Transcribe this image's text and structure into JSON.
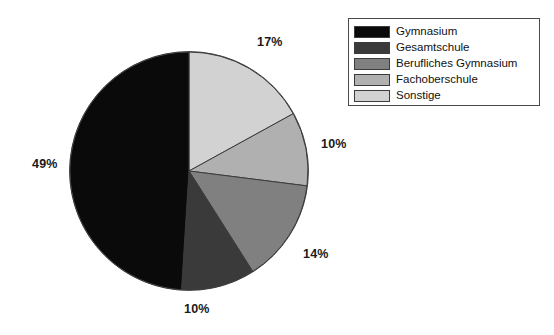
{
  "chart_data": {
    "type": "pie",
    "title": "",
    "subtitle": "",
    "xlabel": "",
    "ylabel": "",
    "legend_position": "top-right",
    "grid": false,
    "start_angle_deg": 0,
    "direction": "clockwise",
    "categories": [
      "Gymnasium",
      "Gesamtschule",
      "Berufliches Gymnasium",
      "Fachoberschule",
      "Sonstige"
    ],
    "values": [
      49,
      10,
      14,
      10,
      17
    ],
    "value_labels": [
      "49%",
      "10%",
      "14%",
      "10%",
      "17%"
    ],
    "colors": [
      "#0a0a0a",
      "#3a3a3a",
      "#808080",
      "#b0b0b0",
      "#d2d2d2"
    ],
    "slices": [
      {
        "label": "Sonstige",
        "value": 17,
        "value_label": "17%",
        "color": "#d2d2d2",
        "start_deg": 0,
        "end_deg": 61.2
      },
      {
        "label": "Fachoberschule",
        "value": 10,
        "value_label": "10%",
        "color": "#b0b0b0",
        "start_deg": 61.2,
        "end_deg": 97.2
      },
      {
        "label": "Berufliches Gymnasium",
        "value": 14,
        "value_label": "14%",
        "color": "#808080",
        "start_deg": 97.2,
        "end_deg": 147.6
      },
      {
        "label": "Gesamtschule",
        "value": 10,
        "value_label": "10%",
        "color": "#3a3a3a",
        "start_deg": 147.6,
        "end_deg": 183.6
      },
      {
        "label": "Gymnasium",
        "value": 49,
        "value_label": "49%",
        "color": "#0a0a0a",
        "start_deg": 183.6,
        "end_deg": 360
      }
    ]
  },
  "pie": {
    "labels": {
      "sonstige": "17%",
      "fachoberschule": "10%",
      "berufliches_gymnasium": "14%",
      "gesamtschule": "10%",
      "gymnasium": "49%"
    }
  },
  "legend": {
    "items": [
      {
        "label": "Gymnasium",
        "color": "#0a0a0a"
      },
      {
        "label": "Gesamtschule",
        "color": "#3a3a3a"
      },
      {
        "label": "Berufliches Gymnasium",
        "color": "#808080"
      },
      {
        "label": "Fachoberschule",
        "color": "#b0b0b0"
      },
      {
        "label": "Sonstige",
        "color": "#d2d2d2"
      }
    ]
  },
  "style": {
    "background": "#ffffff",
    "outline": "#3c3c3c",
    "text": "#111111"
  }
}
